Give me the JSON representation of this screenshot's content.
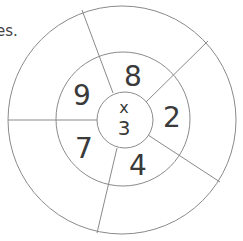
{
  "caption": "es.",
  "diagram": {
    "type": "multiplication-wheel",
    "center": {
      "operator": "x",
      "multiplier": "3"
    },
    "inner_ring_numbers": [
      {
        "value": "8",
        "position": "top"
      },
      {
        "value": "2",
        "position": "right"
      },
      {
        "value": "4",
        "position": "bottom"
      },
      {
        "value": "7",
        "position": "lower-left"
      },
      {
        "value": "9",
        "position": "upper-left"
      }
    ],
    "outer_ring_answers": [
      "",
      "",
      "",
      "",
      ""
    ],
    "colors": {
      "line": "#8a8a8a",
      "text": "#3a3a3a"
    }
  }
}
